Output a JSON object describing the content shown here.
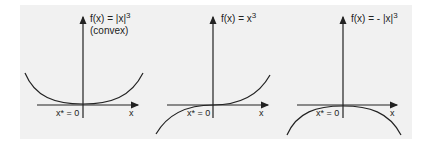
{
  "figure": {
    "panels": [
      {
        "id": "abs-cubed",
        "function_label": "f(x) = |x|",
        "exponent": "3",
        "subtitle": "(convex)",
        "x_axis_label": "x",
        "minimizer_label": "x* = 0"
      },
      {
        "id": "cubed",
        "function_label": "f(x) = x",
        "exponent": "3",
        "subtitle": "",
        "x_axis_label": "x",
        "minimizer_label": "x* = 0"
      },
      {
        "id": "neg-abs-cubed",
        "function_label": "f(x) = - |x|",
        "exponent": "3",
        "subtitle": "",
        "x_axis_label": "x",
        "minimizer_label": "x* = 0"
      }
    ],
    "colors": {
      "background": "#f1f1f1",
      "stroke": "#222222"
    }
  }
}
